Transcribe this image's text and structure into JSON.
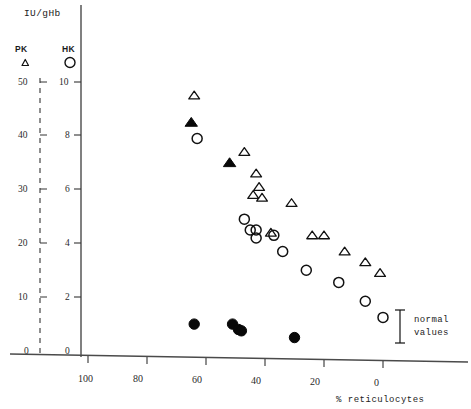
{
  "figure": {
    "y_axis_title": "IU/gHb",
    "x_axis_title": "% reticulocytes",
    "annotation": {
      "line1": "normal",
      "line2": "values"
    }
  },
  "legend": {
    "items": [
      {
        "label": "PK",
        "marker": "open-triangle"
      },
      {
        "label": "HK",
        "marker": "open-circle"
      }
    ]
  },
  "axes": {
    "left": {
      "name": "PK",
      "style": "dashed",
      "ticks": [
        "50",
        "40",
        "30",
        "20",
        "10",
        "0"
      ],
      "range": [
        0,
        50
      ]
    },
    "right": {
      "name": "HK",
      "style": "solid",
      "ticks": [
        "10",
        "8",
        "6",
        "4",
        "2",
        "0"
      ],
      "range": [
        0,
        10
      ]
    },
    "x": {
      "ticks": [
        "100",
        "80",
        "60",
        "40",
        "20",
        "0"
      ],
      "range": [
        100,
        0
      ],
      "reversed": true
    }
  },
  "chart_data": {
    "type": "scatter",
    "title": "IU/gHb",
    "xlabel": "% reticulocytes",
    "ylabel": "IU/gHb",
    "xlim": [
      105,
      -8
    ],
    "ylim": [
      0,
      10
    ],
    "grid": false,
    "legend_position": "top-left",
    "axis_note": "PK series read on left dashed axis (0-50); HK series read on right solid axis (0-10)",
    "series": [
      {
        "name": "PK open triangle",
        "marker": "open-triangle",
        "axis": "left",
        "points": [
          {
            "x": 64,
            "y": 47.5
          },
          {
            "x": 47,
            "y": 37.0
          },
          {
            "x": 43,
            "y": 33.0
          },
          {
            "x": 42,
            "y": 30.5
          },
          {
            "x": 41,
            "y": 28.5
          },
          {
            "x": 44,
            "y": 29.0
          },
          {
            "x": 31,
            "y": 27.5
          },
          {
            "x": 38,
            "y": 22.0
          },
          {
            "x": 24,
            "y": 21.5
          },
          {
            "x": 20,
            "y": 21.5
          },
          {
            "x": 13,
            "y": 18.5
          },
          {
            "x": 6,
            "y": 16.5
          },
          {
            "x": 1,
            "y": 14.5
          }
        ]
      },
      {
        "name": "PK filled triangle",
        "marker": "filled-triangle",
        "axis": "left",
        "points": [
          {
            "x": 65,
            "y": 42.5
          },
          {
            "x": 52,
            "y": 35.0
          }
        ]
      },
      {
        "name": "HK open circle",
        "marker": "open-circle",
        "axis": "right",
        "points": [
          {
            "x": 63,
            "y": 7.9
          },
          {
            "x": 47,
            "y": 4.9
          },
          {
            "x": 45,
            "y": 4.5
          },
          {
            "x": 43,
            "y": 4.5
          },
          {
            "x": 43,
            "y": 4.2
          },
          {
            "x": 37,
            "y": 4.3
          },
          {
            "x": 34,
            "y": 3.7
          },
          {
            "x": 26,
            "y": 3.0
          },
          {
            "x": 15,
            "y": 2.55
          },
          {
            "x": 6,
            "y": 1.85
          },
          {
            "x": 0,
            "y": 1.25
          }
        ]
      },
      {
        "name": "HK filled circle",
        "marker": "filled-circle",
        "axis": "right",
        "points": [
          {
            "x": 64,
            "y": 1.0
          },
          {
            "x": 51,
            "y": 1.0
          },
          {
            "x": 49,
            "y": 0.8
          },
          {
            "x": 48,
            "y": 0.75
          },
          {
            "x": 30,
            "y": 0.5
          }
        ]
      }
    ],
    "annotations": [
      {
        "type": "range-bar",
        "text": "normal values",
        "y_low": 1.2,
        "y_high": 2.3
      }
    ]
  }
}
